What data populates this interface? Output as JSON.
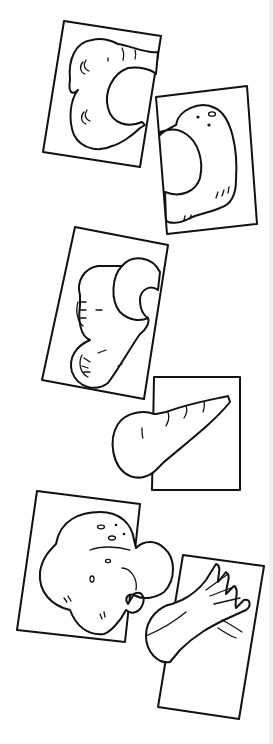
{
  "image": {
    "description": "Black and white line drawing of five rotated picture cards arranged as matching puzzle pairs showing vegetables",
    "background": "#ffffff",
    "stroke_color": "#111111"
  },
  "cards": [
    {
      "id": 1,
      "subject": "parsnips",
      "label": "Parsnips card"
    },
    {
      "id": 2,
      "subject": "potato",
      "label": "Potato card"
    },
    {
      "id": 3,
      "subject": "carrots-cut",
      "label": "Cut carrots card"
    },
    {
      "id": 4,
      "subject": "carrot",
      "label": "Carrot card"
    },
    {
      "id": 5,
      "subject": "potatoes",
      "label": "Potatoes card"
    },
    {
      "id": 6,
      "subject": "leek",
      "label": "Leek card"
    }
  ]
}
